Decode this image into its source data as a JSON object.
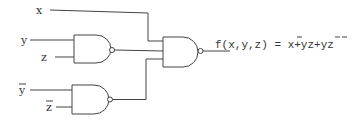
{
  "diagram": {
    "type": "logic-circuit",
    "inputs": [
      {
        "id": "x",
        "label": "x",
        "negated": false
      },
      {
        "id": "y",
        "label": "y",
        "negated": false
      },
      {
        "id": "z",
        "label": "z",
        "negated": false
      },
      {
        "id": "ybar",
        "label": "y",
        "negated": true
      },
      {
        "id": "zbar",
        "label": "z",
        "negated": true
      }
    ],
    "gates": [
      {
        "id": "g1",
        "type": "NAND",
        "inputs": [
          "y",
          "z"
        ]
      },
      {
        "id": "g2",
        "type": "NAND",
        "inputs": [
          "ybar",
          "zbar"
        ]
      },
      {
        "id": "g3",
        "type": "NAND",
        "inputs": [
          "x",
          "g1",
          "g2"
        ]
      }
    ],
    "output": {
      "lhs": "f(x,y,z) = ",
      "terms": [
        {
          "text": "x",
          "negated": true
        },
        {
          "text": "+yz+",
          "negated": false
        },
        {
          "text": "y",
          "negated": true
        },
        {
          "text": "z",
          "negated": true
        }
      ],
      "full_text": "f(x,y,z) = x̄+yz+ȳz̄"
    },
    "colors": {
      "line": "#444444",
      "text": "#333333",
      "background": "#ffffff"
    }
  }
}
